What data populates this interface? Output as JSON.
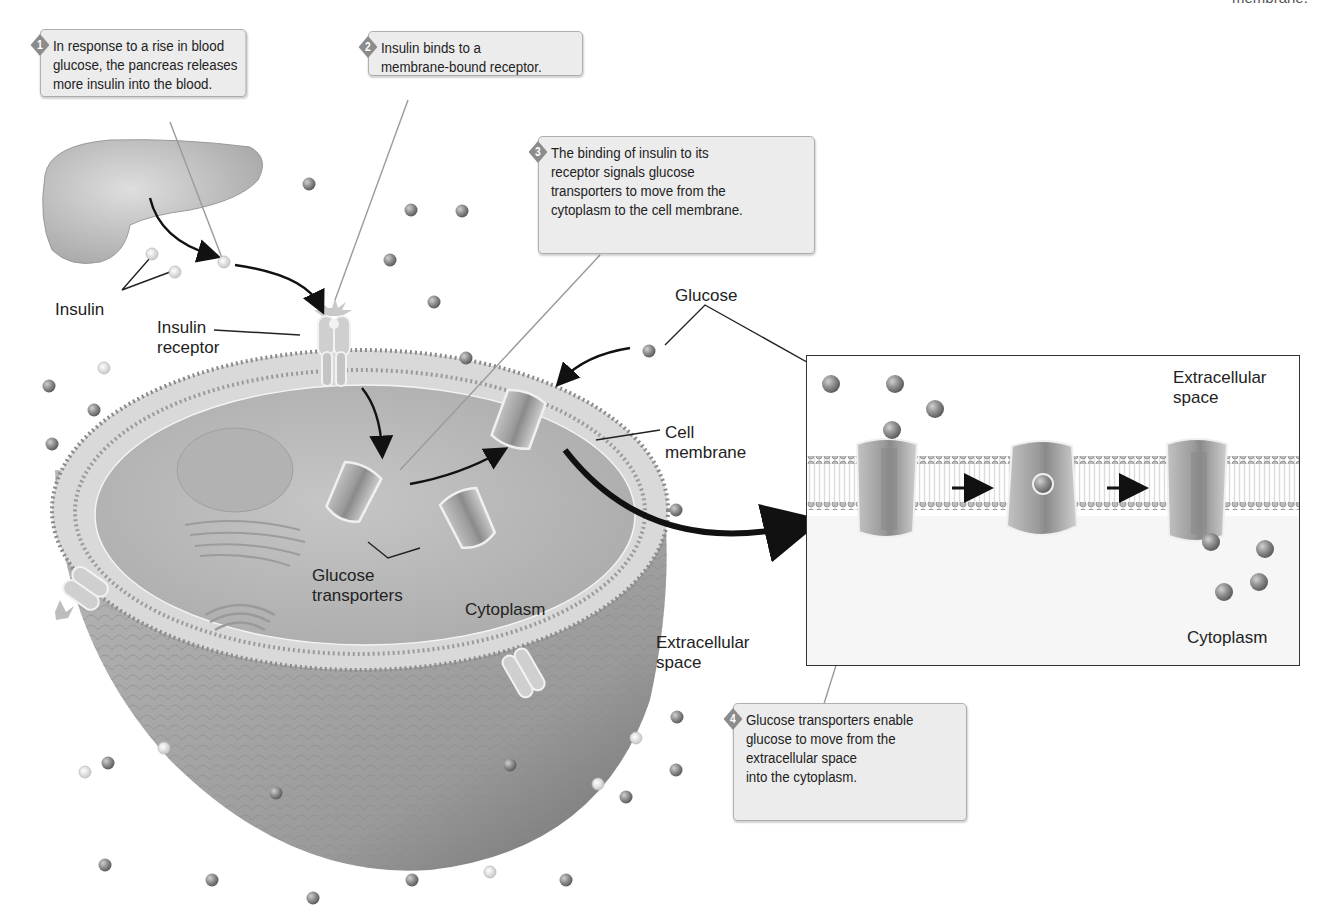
{
  "figure": {
    "title_fragment_top_right": "membrane.",
    "callouts": [
      {
        "step": "1",
        "lines": [
          "In response to a rise in blood",
          "glucose, the pancreas releases",
          "more insulin into the blood."
        ]
      },
      {
        "step": "2",
        "lines": [
          "Insulin binds to a",
          "membrane-bound receptor."
        ]
      },
      {
        "step": "3",
        "lines": [
          "The binding of insulin to its",
          "receptor signals glucose",
          "transporters to move from the",
          "cytoplasm to the cell membrane."
        ]
      },
      {
        "step": "4",
        "lines": [
          "Glucose transporters enable",
          "glucose to move from the",
          "extracellular space",
          "into the cytoplasm."
        ]
      }
    ],
    "labels": {
      "insulin": "Insulin",
      "insulin_receptor": [
        "Insulin",
        "receptor"
      ],
      "glucose": "Glucose",
      "cell_membrane": [
        "Cell",
        "membrane"
      ],
      "glucose_transporters": [
        "Glucose",
        "transporters"
      ],
      "cytoplasm": "Cytoplasm",
      "extracellular_space": [
        "Extracellular",
        "space"
      ]
    },
    "inset": {
      "extracellular_space": [
        "Extracellular",
        "space"
      ],
      "cytoplasm": "Cytoplasm"
    },
    "colors": {
      "glucose": "#8a8a8a",
      "insulin": "#e6e6e6",
      "cytoplasm_fill": "#bdbdbd",
      "membrane_fill": "#d8d8d8",
      "callout_bg": "#ececec",
      "badge": "#8c8c8c",
      "arrow": "#111111"
    }
  }
}
